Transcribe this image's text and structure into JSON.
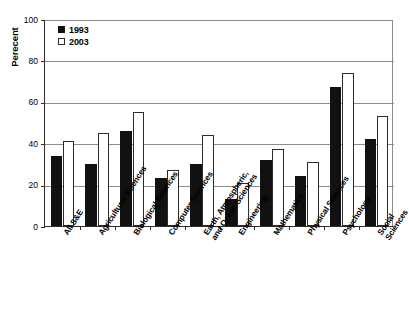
{
  "chart_data": {
    "type": "bar",
    "title": "",
    "xlabel": "",
    "ylabel": "Perecent",
    "ylim": [
      0,
      100
    ],
    "yticks": [
      0,
      20,
      40,
      60,
      80,
      100
    ],
    "grid": true,
    "legend_position": "top-left",
    "categories": [
      "All S&E",
      "Agricultural Sciences",
      "Biological Sciences",
      "Computer Sciences",
      "Earth, Atmospheric,\nand Ocean Sciences",
      "Engineering",
      "Mathematics",
      "Physical Sciences",
      "Psychology",
      "Social Sciences"
    ],
    "series": [
      {
        "name": "1993",
        "color": "#111111",
        "style": "filled",
        "values": [
          34,
          30,
          46,
          23,
          30,
          13,
          32,
          24,
          67,
          42
        ]
      },
      {
        "name": "2003",
        "color": "#ffffff",
        "style": "hollow",
        "values": [
          41,
          45,
          55,
          27,
          44,
          21,
          37,
          31,
          74,
          53
        ]
      }
    ]
  },
  "axis": {
    "y_title": "Perecent",
    "y_tick_labels": [
      "100",
      "80",
      "60",
      "40",
      "20",
      "0"
    ]
  },
  "legend": {
    "entries": [
      {
        "label": "1993",
        "swatch": "filled-square-icon"
      },
      {
        "label": "2003",
        "swatch": "hollow-square-icon"
      }
    ]
  }
}
